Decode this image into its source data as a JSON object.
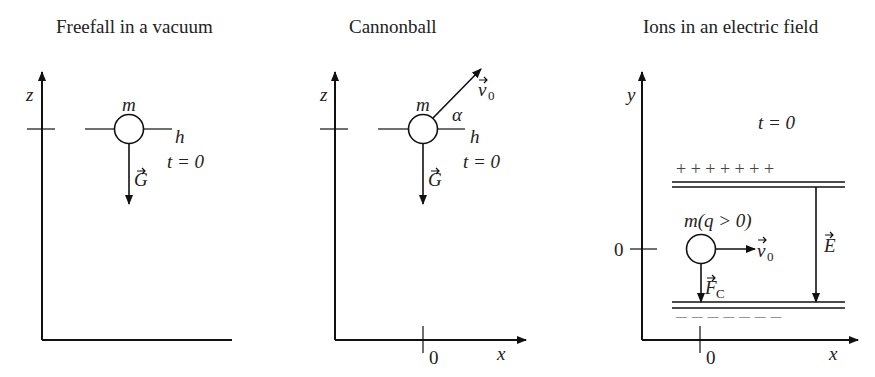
{
  "panels": [
    {
      "title": "Freefall in a vacuum",
      "axis_vertical": "z",
      "mass": "m",
      "height_label": "h",
      "time_label": "t = 0",
      "force_label": "G"
    },
    {
      "title": "Cannonball",
      "axis_vertical": "z",
      "axis_horizontal": "x",
      "origin_label": "0",
      "mass": "m",
      "angle_label": "α",
      "height_label": "h",
      "time_label": "t = 0",
      "force_label": "G",
      "velocity_label": "v",
      "velocity_sub": "0"
    },
    {
      "title": "Ions in an electric field",
      "axis_vertical": "y",
      "axis_horizontal": "x",
      "origin_x_label": "0",
      "origin_y_label": "0",
      "time_label": "t = 0",
      "plus_signs": "+ + + + + + +",
      "minus_signs": "— — — — — — —",
      "mass_label": "m(q > 0)",
      "velocity_label": "v",
      "velocity_sub": "0",
      "field_label": "E",
      "force_label": "F",
      "force_sub": "C"
    }
  ]
}
